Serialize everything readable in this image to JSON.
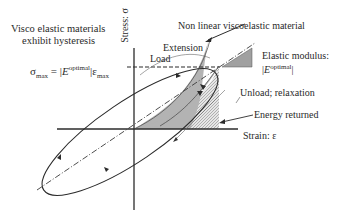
{
  "title": {
    "line1": "Visco elastic materials",
    "line2": "exhibit hysteresis"
  },
  "axes": {
    "y_label": "Stress: σ",
    "x_label": "Strain: ε"
  },
  "equation": {
    "lhs": "σ",
    "lhs_sub": "max",
    "eq": " = ",
    "bar_open": "|",
    "E": "E",
    "E_sup": "optimal",
    "bar_close": "|",
    "eps": "ε",
    "eps_sub": "max"
  },
  "annotations": {
    "nonlinear": "Non linear viscoelastic material",
    "extension": "Extension",
    "load": "Load",
    "elastic_modulus": "Elastic modulus:",
    "elastic_modulus_value_E": "E",
    "elastic_modulus_value_sup": "optimal",
    "unload": "Unload; relaxation",
    "energy_returned": "Energy returned"
  },
  "colors": {
    "line": "#2b2b2b",
    "fill_gray": "#a9a9a9",
    "hatch": "#9a9a9a"
  }
}
